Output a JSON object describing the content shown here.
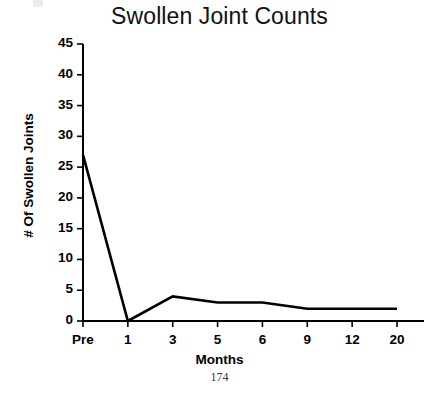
{
  "chart_data": {
    "type": "line",
    "title": "Swollen Joint Counts",
    "xlabel": "Months",
    "ylabel": "# Of Swollen Joints",
    "categories": [
      "Pre",
      "1",
      "3",
      "5",
      "6",
      "9",
      "12",
      "20"
    ],
    "values": [
      27,
      0,
      4,
      3,
      3,
      2,
      2,
      2
    ],
    "series": [
      {
        "name": "Swollen joint count",
        "values": [
          27,
          0,
          4,
          3,
          3,
          2,
          2,
          2
        ]
      }
    ],
    "ylim": [
      0,
      45
    ],
    "ytick_labels": [
      "0",
      "5",
      "10",
      "15",
      "20",
      "25",
      "30",
      "35",
      "40",
      "45"
    ],
    "ytick_values": [
      0,
      5,
      10,
      15,
      20,
      25,
      30,
      35,
      40,
      45
    ],
    "xtick_labels": [
      "Pre",
      "1",
      "3",
      "5",
      "6",
      "9",
      "12",
      "20"
    ],
    "grid": false,
    "legend": false,
    "legend_position": "none",
    "line_color": "#000000",
    "axis_color": "#000000",
    "background_color": "#ffffff"
  },
  "figure": {
    "page_number": "174"
  }
}
